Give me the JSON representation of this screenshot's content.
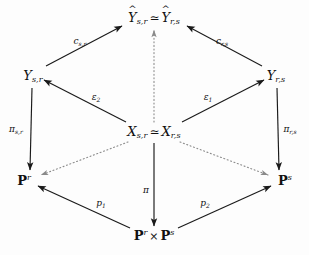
{
  "diagram": {
    "type": "commutative-diagram",
    "title": "",
    "nodes": [
      {
        "id": "top",
        "name": "node-y-hat-iso",
        "latex": "\\widehat{Y}_{s,r} \\simeq \\widehat{Y}_{r,s}",
        "text": "Ŷs,r ≃ Ŷr,s",
        "left": "Y",
        "left_sub": "s,r",
        "left_hat": "^",
        "relation": "≃",
        "right": "Y",
        "right_sub": "r,s",
        "right_hat": "^",
        "x": 154,
        "y": 18
      },
      {
        "id": "left-y",
        "name": "node-y-sr",
        "latex": "Y_{s,r}",
        "text": "Ys,r",
        "base": "Y",
        "sub": "s,r",
        "x": 33,
        "y": 76
      },
      {
        "id": "right-y",
        "name": "node-y-rs",
        "latex": "Y_{r,s}",
        "text": "Yr,s",
        "base": "Y",
        "sub": "r,s",
        "x": 276,
        "y": 76
      },
      {
        "id": "center",
        "name": "node-x-iso",
        "latex": "X_{s,r} \\simeq X_{r,s}",
        "text": "Xs,r ≃ Xr,s",
        "left": "X",
        "left_sub": "s,r",
        "relation": "≃",
        "right": "X",
        "right_sub": "r,s",
        "x": 154,
        "y": 132
      },
      {
        "id": "bottom-left",
        "name": "node-p-r",
        "latex": "\\mathbf{P}^r",
        "text": "Pr",
        "base": "P",
        "sup": "r",
        "x": 24,
        "y": 180
      },
      {
        "id": "bottom-right",
        "name": "node-p-s",
        "latex": "\\mathbf{P}^s",
        "text": "Ps",
        "base": "P",
        "sup": "s",
        "x": 285,
        "y": 180
      },
      {
        "id": "bottom",
        "name": "node-p-r-times-p-s",
        "latex": "\\mathbf{P}^r \\times \\mathbf{P}^s",
        "text": "Pr × Ps",
        "left": "P",
        "left_sup": "r",
        "operator": "×",
        "right": "P",
        "right_sup": "s",
        "x": 154,
        "y": 235
      }
    ],
    "edges": [
      {
        "id": "e-csr",
        "name": "arrow-c-s-r",
        "from": "left-y",
        "to": "top",
        "style": "solid",
        "label": "c",
        "label_sub": "s,r",
        "label_text": "cs,r",
        "label_x": 80,
        "label_y": 42
      },
      {
        "id": "e-crs",
        "name": "arrow-c-r-s",
        "from": "right-y",
        "to": "top",
        "style": "solid",
        "label": "c",
        "label_sub": "r,s",
        "label_text": "cr,s",
        "label_x": 222,
        "label_y": 42
      },
      {
        "id": "e-eps2",
        "name": "arrow-epsilon-2",
        "from": "center",
        "to": "left-y",
        "style": "solid",
        "label": "ε",
        "label_sub": "2",
        "label_text": "ε2",
        "label_x": 96,
        "label_y": 98
      },
      {
        "id": "e-eps1",
        "name": "arrow-epsilon-1",
        "from": "center",
        "to": "right-y",
        "style": "solid",
        "label": "ε",
        "label_sub": "1",
        "label_text": "ε1",
        "label_x": 208,
        "label_y": 98
      },
      {
        "id": "e-pisr",
        "name": "arrow-pi-s-r",
        "from": "left-y",
        "to": "bottom-left",
        "style": "solid",
        "label": "π",
        "label_sub": "s,r",
        "label_text": "πs,r",
        "label_x": 16,
        "label_y": 130
      },
      {
        "id": "e-pirs",
        "name": "arrow-pi-r-s",
        "from": "right-y",
        "to": "bottom-right",
        "style": "solid",
        "label": "π",
        "label_sub": "r,s",
        "label_text": "πr,s",
        "label_x": 290,
        "label_y": 130
      },
      {
        "id": "e-dot-left",
        "name": "arrow-dotted-center-to-p-r",
        "from": "center",
        "to": "bottom-left",
        "style": "dotted",
        "label": "",
        "label_text": ""
      },
      {
        "id": "e-dot-right",
        "name": "arrow-dotted-center-to-p-s",
        "from": "center",
        "to": "bottom-right",
        "style": "dotted",
        "label": "",
        "label_text": ""
      },
      {
        "id": "e-dot-vert",
        "name": "arrow-dotted-center-to-top",
        "from": "center",
        "to": "top",
        "style": "dotted",
        "label": "",
        "label_text": ""
      },
      {
        "id": "e-pi",
        "name": "arrow-pi",
        "from": "center",
        "to": "bottom",
        "style": "solid",
        "label": "π",
        "label_sub": "",
        "label_text": "π",
        "label_x": 146,
        "label_y": 190
      },
      {
        "id": "e-p1",
        "name": "arrow-p-1",
        "from": "bottom",
        "to": "bottom-left",
        "style": "solid",
        "label": "p",
        "label_sub": "1",
        "label_text": "p1",
        "label_x": 101,
        "label_y": 204
      },
      {
        "id": "e-p2",
        "name": "arrow-p-2",
        "from": "bottom",
        "to": "bottom-right",
        "style": "solid",
        "label": "p",
        "label_sub": "2",
        "label_text": "p2",
        "label_x": 205,
        "label_y": 204
      }
    ],
    "colors": {
      "stroke": "#1a1a1a",
      "dotted_stroke": "#8a8a8a",
      "text": "#111111",
      "background": "#fdfdfd"
    }
  }
}
